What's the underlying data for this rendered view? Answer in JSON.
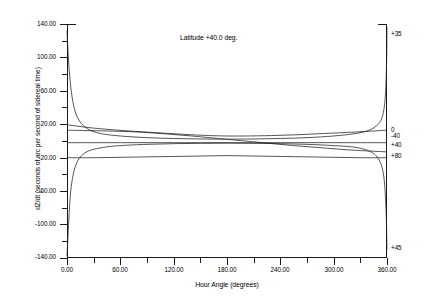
{
  "chart_data": {
    "type": "line",
    "title": "Latitude +40.0 deg.",
    "xlabel": "Hour Angle (degrees)",
    "ylabel": "dZ/dt (seconds of arc per second of sidereal time)",
    "xlim": [
      0,
      360
    ],
    "ylim": [
      -140,
      140
    ],
    "grid": false,
    "legend_position": "right-edge-inline",
    "x_ticks": [
      "0.00",
      "60.00",
      "120.00",
      "180.00",
      "240.00",
      "300.00",
      "360.00"
    ],
    "x_tick_values": [
      0,
      60,
      120,
      180,
      240,
      300,
      360
    ],
    "x_minor_tick_values": [
      30,
      90,
      150,
      210,
      270,
      330
    ],
    "y_ticks": [
      "140.00",
      "100.00",
      "60.00",
      "20.00",
      "-20.00",
      "-60.00",
      "-100.00",
      "-140.00"
    ],
    "y_tick_values": [
      140,
      100,
      60,
      20,
      -20,
      -60,
      -100,
      -140
    ],
    "y_minor_tick_values": [
      120,
      80,
      40,
      0,
      -40,
      -80,
      -120
    ],
    "series": [
      {
        "name": "+35",
        "label": "+35",
        "label_x": 360,
        "label_y": 128,
        "points": [
          [
            0,
            -138
          ],
          [
            2,
            -95
          ],
          [
            4,
            -62
          ],
          [
            7,
            -40
          ],
          [
            11,
            -26
          ],
          [
            16,
            -18
          ],
          [
            22,
            -13
          ],
          [
            30,
            -10
          ],
          [
            45,
            -7
          ],
          [
            60,
            -5.5
          ],
          [
            90,
            -4
          ],
          [
            120,
            -3.2
          ],
          [
            150,
            -2.8
          ],
          [
            180,
            -2.6
          ],
          [
            210,
            -2.8
          ],
          [
            240,
            -3.2
          ],
          [
            270,
            -4
          ],
          [
            300,
            -5.5
          ],
          [
            320,
            -7
          ],
          [
            335,
            -10
          ],
          [
            345,
            -15
          ],
          [
            350,
            -21
          ],
          [
            354,
            -30
          ],
          [
            357,
            -48
          ],
          [
            359,
            -85
          ],
          [
            360,
            -130
          ]
        ]
      },
      {
        "name": "0",
        "label": "0",
        "label_x": 360,
        "label_y": 13,
        "points": [
          [
            0,
            13
          ],
          [
            20,
            12.5
          ],
          [
            45,
            12
          ],
          [
            75,
            11
          ],
          [
            105,
            9
          ],
          [
            135,
            6.5
          ],
          [
            165,
            3.5
          ],
          [
            180,
            2
          ],
          [
            195,
            0.5
          ],
          [
            225,
            -2.5
          ],
          [
            255,
            -5.5
          ],
          [
            285,
            -8
          ],
          [
            315,
            -10.5
          ],
          [
            340,
            -12
          ],
          [
            360,
            -13
          ]
        ]
      },
      {
        "name": "-40",
        "label": "-40",
        "label_x": 360,
        "label_y": 6,
        "points": [
          [
            0,
            19.5
          ],
          [
            10,
            18
          ],
          [
            25,
            16
          ],
          [
            45,
            14
          ],
          [
            70,
            12
          ],
          [
            100,
            10
          ],
          [
            130,
            8
          ],
          [
            160,
            6.5
          ],
          [
            180,
            6
          ],
          [
            200,
            6
          ],
          [
            230,
            6.5
          ],
          [
            260,
            7.5
          ],
          [
            290,
            9
          ],
          [
            320,
            10.5
          ],
          [
            345,
            12
          ],
          [
            360,
            13
          ]
        ]
      },
      {
        "name": "+40",
        "label": "+40",
        "label_x": 360,
        "label_y": -5,
        "points": [
          [
            0,
            -2
          ],
          [
            30,
            -2
          ],
          [
            60,
            -2
          ],
          [
            90,
            -2
          ],
          [
            120,
            -2
          ],
          [
            150,
            -2
          ],
          [
            180,
            -2
          ],
          [
            210,
            -2
          ],
          [
            240,
            -2
          ],
          [
            270,
            -2
          ],
          [
            300,
            -2
          ],
          [
            330,
            -2
          ],
          [
            360,
            -2
          ]
        ]
      },
      {
        "name": "+80",
        "label": "+80",
        "label_x": 360,
        "label_y": -18,
        "points": [
          [
            0,
            -20
          ],
          [
            30,
            -20
          ],
          [
            60,
            -19.5
          ],
          [
            90,
            -19
          ],
          [
            120,
            -18.5
          ],
          [
            150,
            -18
          ],
          [
            180,
            -17.5
          ],
          [
            210,
            -18
          ],
          [
            240,
            -18.5
          ],
          [
            270,
            -19
          ],
          [
            300,
            -19.5
          ],
          [
            330,
            -20
          ],
          [
            360,
            -20
          ]
        ]
      },
      {
        "name": "+45",
        "label": "+45",
        "label_x": 360,
        "label_y": -128,
        "points": [
          [
            0,
            132
          ],
          [
            2,
            92
          ],
          [
            5,
            58
          ],
          [
            9,
            36
          ],
          [
            14,
            24
          ],
          [
            20,
            17
          ],
          [
            28,
            12
          ],
          [
            40,
            8.5
          ],
          [
            60,
            6
          ],
          [
            90,
            4
          ],
          [
            120,
            3
          ],
          [
            150,
            2.4
          ],
          [
            180,
            2.2
          ],
          [
            210,
            2.4
          ],
          [
            240,
            3
          ],
          [
            270,
            4
          ],
          [
            300,
            6
          ],
          [
            325,
            9
          ],
          [
            340,
            13
          ],
          [
            350,
            20
          ],
          [
            355,
            30
          ],
          [
            358,
            52
          ],
          [
            359.5,
            92
          ],
          [
            360,
            136
          ]
        ]
      }
    ]
  }
}
